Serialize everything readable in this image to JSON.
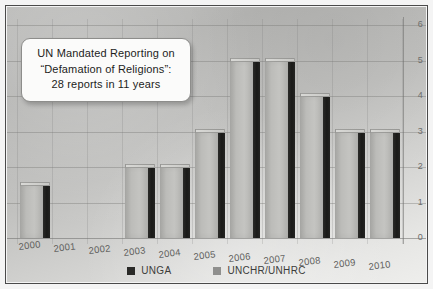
{
  "callout": {
    "line1": "UN Mandated Reporting on",
    "line2": "“Defamation of Religions”:",
    "line3": "28 reports in 11 years"
  },
  "legend": {
    "items": [
      {
        "label": "UNGA",
        "color": "#2a2a28"
      },
      {
        "label": "UNCHR/UNHRC",
        "color": "#8f8f8d"
      }
    ]
  },
  "axis": {
    "y_ticks": [
      "0",
      "1",
      "2",
      "3",
      "4",
      "5",
      "6"
    ],
    "y_axis_position": "right"
  },
  "chart_data": {
    "type": "bar",
    "title": "UN Mandated Reporting on “Defamation of Religions”: 28 reports in 11 years",
    "categories": [
      "2000",
      "2001",
      "2002",
      "2003",
      "2004",
      "2005",
      "2006",
      "2007",
      "2008",
      "2009",
      "2010"
    ],
    "values": [
      1.5,
      0,
      0,
      2,
      2,
      3,
      5,
      5,
      4,
      3,
      3
    ],
    "series": [
      {
        "name": "Reports",
        "values": [
          1.5,
          0,
          0,
          2,
          2,
          3,
          5,
          5,
          4,
          3,
          3
        ]
      }
    ],
    "xlabel": "",
    "ylabel": "",
    "ylim": [
      0,
      6
    ],
    "ytick_values": [
      0,
      1,
      2,
      3,
      4,
      5,
      6
    ],
    "grid": true,
    "legend_position": "bottom",
    "legend_entries": [
      "UNGA",
      "UNCHR/UNHRC"
    ],
    "style": "3d-bar",
    "total_reports": 28,
    "span_years": 11
  }
}
